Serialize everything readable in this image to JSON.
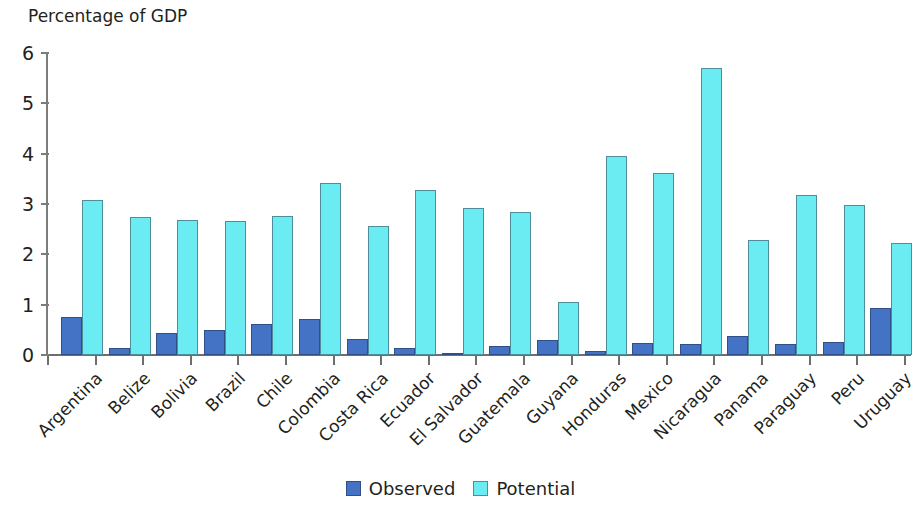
{
  "chart_data": {
    "type": "bar",
    "title": "Percentage of GDP",
    "xlabel": "",
    "ylabel": "",
    "ylim": [
      0,
      6
    ],
    "yticks": [
      0,
      1,
      2,
      3,
      4,
      5,
      6
    ],
    "grid": false,
    "legend_position": "bottom",
    "categories": [
      "Argentina",
      "Belize",
      "Bolivia",
      "Brazil",
      "Chile",
      "Colombia",
      "Costa Rica",
      "Ecuador",
      "El Salvador",
      "Guatemala",
      "Guyana",
      "Honduras",
      "Mexico",
      "Nicaragua",
      "Panama",
      "Paraguay",
      "Peru",
      "Uruguay"
    ],
    "series": [
      {
        "name": "Observed",
        "color": "#4472c4",
        "values": [
          0.76,
          0.13,
          0.43,
          0.49,
          0.62,
          0.72,
          0.31,
          0.13,
          0.02,
          0.17,
          0.3,
          0.08,
          0.24,
          0.22,
          0.37,
          0.22,
          0.25,
          0.93
        ]
      },
      {
        "name": "Potential",
        "color": "#6bebf2",
        "values": [
          3.07,
          2.74,
          2.69,
          2.66,
          2.76,
          3.42,
          2.57,
          3.28,
          2.93,
          2.84,
          1.06,
          3.95,
          3.61,
          5.7,
          2.28,
          3.17,
          2.98,
          2.23
        ]
      }
    ]
  },
  "legend": {
    "items": [
      {
        "label": "Observed",
        "swatch": "observed"
      },
      {
        "label": "Potential",
        "swatch": "potential"
      }
    ]
  }
}
